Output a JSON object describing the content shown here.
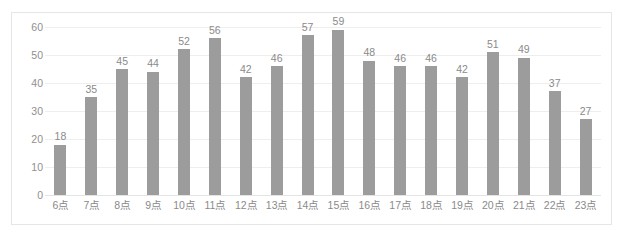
{
  "chart_data": {
    "type": "bar",
    "title": "",
    "subtitle": "",
    "xlabel": "",
    "ylabel": "",
    "categories": [
      "6点",
      "7点",
      "8点",
      "9点",
      "10点",
      "11点",
      "12点",
      "13点",
      "14点",
      "15点",
      "16点",
      "17点",
      "18点",
      "19点",
      "20点",
      "21点",
      "22点",
      "23点"
    ],
    "values": [
      18,
      35,
      45,
      44,
      52,
      56,
      42,
      46,
      57,
      59,
      48,
      46,
      46,
      42,
      51,
      49,
      37,
      27
    ],
    "data_labels": [
      "18",
      "35",
      "45",
      "44",
      "52",
      "56",
      "42",
      "46",
      "57",
      "59",
      "48",
      "46",
      "46",
      "42",
      "51",
      "49",
      "37",
      "27"
    ],
    "ylim": [
      0,
      60
    ],
    "y_ticks": [
      0,
      10,
      20,
      30,
      40,
      50,
      60
    ],
    "y_tick_labels": [
      "0",
      "10",
      "20",
      "30",
      "40",
      "50",
      "60"
    ],
    "grid": true,
    "grid_axis": "y",
    "legend": false,
    "legend_position": "none",
    "bar_color": "#9c9c9c",
    "gridline_color": "#eeeeee",
    "label_color": "#8a8a8a",
    "border_color": "#e6e6e6",
    "background_color": "#ffffff"
  },
  "caption": {
    "text": ""
  }
}
